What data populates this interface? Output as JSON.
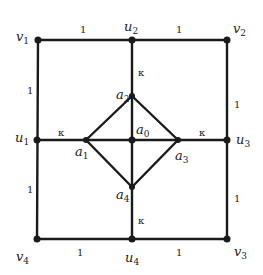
{
  "diagram": {
    "type": "graph",
    "nodes": [
      {
        "id": "v1",
        "name": "v",
        "sub": "1",
        "x": 38,
        "y": 40
      },
      {
        "id": "u2",
        "name": "u",
        "sub": "2",
        "x": 132,
        "y": 40
      },
      {
        "id": "v2",
        "name": "v",
        "sub": "2",
        "x": 227,
        "y": 40
      },
      {
        "id": "u1",
        "name": "u",
        "sub": "1",
        "x": 37,
        "y": 140
      },
      {
        "id": "a0",
        "name": "a",
        "sub": "0",
        "x": 132,
        "y": 140
      },
      {
        "id": "u3",
        "name": "u",
        "sub": "3",
        "x": 227,
        "y": 140
      },
      {
        "id": "v4",
        "name": "v",
        "sub": "4",
        "x": 37,
        "y": 239
      },
      {
        "id": "u4",
        "name": "u",
        "sub": "4",
        "x": 132,
        "y": 239
      },
      {
        "id": "v3",
        "name": "v",
        "sub": "3",
        "x": 227,
        "y": 239
      },
      {
        "id": "a1",
        "name": "a",
        "sub": "1",
        "x": 86,
        "y": 140
      },
      {
        "id": "a2",
        "name": "a",
        "sub": "2",
        "x": 132,
        "y": 96
      },
      {
        "id": "a3",
        "name": "a",
        "sub": "3",
        "x": 178,
        "y": 140
      },
      {
        "id": "a4",
        "name": "a",
        "sub": "4",
        "x": 132,
        "y": 187
      }
    ],
    "edges": [
      {
        "from": "v1",
        "to": "u2",
        "weight": "1"
      },
      {
        "from": "u2",
        "to": "v2",
        "weight": "1"
      },
      {
        "from": "v2",
        "to": "u3",
        "weight": "1"
      },
      {
        "from": "u3",
        "to": "v3",
        "weight": "1"
      },
      {
        "from": "v4",
        "to": "u4",
        "weight": "1"
      },
      {
        "from": "u4",
        "to": "v3",
        "weight": "1"
      },
      {
        "from": "v1",
        "to": "u1",
        "weight": "1"
      },
      {
        "from": "u1",
        "to": "v4",
        "weight": "1"
      },
      {
        "from": "u2",
        "to": "a2",
        "weight": "κ"
      },
      {
        "from": "u1",
        "to": "a1",
        "weight": "κ"
      },
      {
        "from": "a3",
        "to": "u3",
        "weight": "κ"
      },
      {
        "from": "a4",
        "to": "u4",
        "weight": "κ"
      },
      {
        "from": "a1",
        "to": "a2",
        "weight": ""
      },
      {
        "from": "a2",
        "to": "a3",
        "weight": ""
      },
      {
        "from": "a3",
        "to": "a4",
        "weight": ""
      },
      {
        "from": "a4",
        "to": "a1",
        "weight": ""
      },
      {
        "from": "a1",
        "to": "a0",
        "weight": ""
      },
      {
        "from": "a0",
        "to": "a3",
        "weight": ""
      },
      {
        "from": "a2",
        "to": "a0",
        "weight": ""
      },
      {
        "from": "a0",
        "to": "a4",
        "weight": ""
      }
    ],
    "labels": {
      "v1": {
        "name": "v",
        "sub": "1"
      },
      "v2": {
        "name": "v",
        "sub": "2"
      },
      "v3": {
        "name": "v",
        "sub": "3"
      },
      "v4": {
        "name": "v",
        "sub": "4"
      },
      "u1": {
        "name": "u",
        "sub": "1"
      },
      "u2": {
        "name": "u",
        "sub": "2"
      },
      "u3": {
        "name": "u",
        "sub": "3"
      },
      "u4": {
        "name": "u",
        "sub": "4"
      },
      "a0": {
        "name": "a",
        "sub": "0"
      },
      "a1": {
        "name": "a",
        "sub": "1"
      },
      "a2": {
        "name": "a",
        "sub": "2"
      },
      "a3": {
        "name": "a",
        "sub": "3"
      },
      "a4": {
        "name": "a",
        "sub": "4"
      }
    },
    "weights": {
      "one": "1",
      "kappa": "κ"
    }
  }
}
